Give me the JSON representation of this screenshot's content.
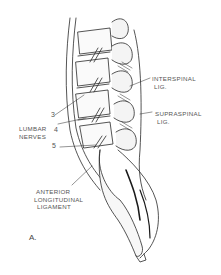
{
  "figure": {
    "panel_label": "A.",
    "labels": {
      "interspinal_line1": "INTERSPINAL",
      "interspinal_line2": "LIG.",
      "supraspinal_line1": "SUPRASPINAL",
      "supraspinal_line2": "LIG.",
      "lumbar_line1": "LUMBAR",
      "lumbar_line2": "NERVES",
      "anterior_line1": "ANTERIOR",
      "anterior_line2": "LONGITUDINAL",
      "anterior_line3": "LIGAMENT"
    },
    "nerve_numbers": [
      "3",
      "4",
      "5"
    ],
    "colors": {
      "ink": "#2a2a2a",
      "label": "#555555",
      "background": "#ffffff"
    }
  }
}
